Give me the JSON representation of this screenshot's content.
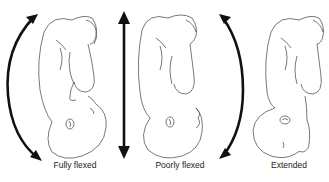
{
  "diagram": {
    "panels": [
      {
        "id": "fully-flexed",
        "label": "Fully flexed",
        "arrow": "curved-left"
      },
      {
        "id": "poorly-flexed",
        "label": "Poorly flexed",
        "arrow": "straight-vertical"
      },
      {
        "id": "extended",
        "label": "Extended",
        "arrow": "curved-right"
      }
    ],
    "colors": {
      "line": "#555555",
      "arrow": "#111111",
      "background": "#ffffff",
      "text": "#222222"
    }
  }
}
